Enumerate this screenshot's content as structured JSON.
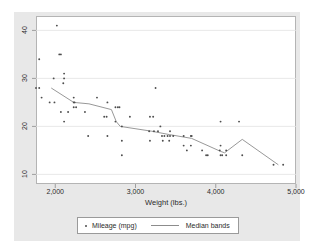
{
  "chart_data": {
    "type": "scatter",
    "title": "",
    "xlabel": "Weight (lbs.)",
    "ylabel": "",
    "xlim": [
      1760,
      5000
    ],
    "ylim": [
      8,
      43
    ],
    "xticks": [
      2000,
      3000,
      4000,
      5000
    ],
    "xtick_labels": [
      "2,000",
      "3,000",
      "4,000",
      "5,000"
    ],
    "yticks": [
      10,
      20,
      30,
      40
    ],
    "ytick_labels": [
      "10",
      "20",
      "30",
      "40"
    ],
    "grid": "horizontal",
    "legend_position": "bottom",
    "legend": [
      {
        "label": "Mileage (mpg)",
        "marker": "dot",
        "color": "#4d4d4d"
      },
      {
        "label": "Median bands",
        "marker": "line",
        "color": "#8c8c8c"
      }
    ],
    "series": [
      {
        "name": "Mileage (mpg)",
        "type": "scatter",
        "color": "#4d4d4d",
        "points": [
          [
            2020,
            41
          ],
          [
            1800,
            34
          ],
          [
            2050,
            35
          ],
          [
            2070,
            35
          ],
          [
            1980,
            30
          ],
          [
            2110,
            31
          ],
          [
            2110,
            30
          ],
          [
            2100,
            29
          ],
          [
            1760,
            28
          ],
          [
            1800,
            28
          ],
          [
            3250,
            28
          ],
          [
            1830,
            26
          ],
          [
            2230,
            26
          ],
          [
            2520,
            26
          ],
          [
            1930,
            25
          ],
          [
            1990,
            25
          ],
          [
            2230,
            25
          ],
          [
            2240,
            25
          ],
          [
            2650,
            25
          ],
          [
            2230,
            24
          ],
          [
            2260,
            24
          ],
          [
            2750,
            24
          ],
          [
            2780,
            24
          ],
          [
            2800,
            24
          ],
          [
            2070,
            23
          ],
          [
            2160,
            23
          ],
          [
            2370,
            23
          ],
          [
            2610,
            22
          ],
          [
            2640,
            22
          ],
          [
            2930,
            22
          ],
          [
            3180,
            22
          ],
          [
            3220,
            22
          ],
          [
            2110,
            21
          ],
          [
            2750,
            21
          ],
          [
            4060,
            21
          ],
          [
            4290,
            21
          ],
          [
            2830,
            20
          ],
          [
            3310,
            20
          ],
          [
            3170,
            19
          ],
          [
            3230,
            19
          ],
          [
            3280,
            19
          ],
          [
            3430,
            19
          ],
          [
            2410,
            18
          ],
          [
            2650,
            18
          ],
          [
            3330,
            18
          ],
          [
            3360,
            18
          ],
          [
            3400,
            18
          ],
          [
            3430,
            18
          ],
          [
            3470,
            18
          ],
          [
            3600,
            18
          ],
          [
            3690,
            18
          ],
          [
            3700,
            18
          ],
          [
            2830,
            17
          ],
          [
            3180,
            17
          ],
          [
            3340,
            17
          ],
          [
            3420,
            17
          ],
          [
            3600,
            16
          ],
          [
            3690,
            16
          ],
          [
            4060,
            16
          ],
          [
            3640,
            15
          ],
          [
            3830,
            15
          ],
          [
            4050,
            15
          ],
          [
            4130,
            15
          ],
          [
            4080,
            14
          ],
          [
            2830,
            14
          ],
          [
            3880,
            14
          ],
          [
            3900,
            14
          ],
          [
            4060,
            14
          ],
          [
            4130,
            14
          ],
          [
            4330,
            14
          ],
          [
            4720,
            12
          ],
          [
            4840,
            12
          ]
        ]
      },
      {
        "name": "Median bands",
        "type": "line",
        "color": "#8c8c8c",
        "points": [
          [
            1950,
            28
          ],
          [
            2230,
            25
          ],
          [
            2420,
            24.7
          ],
          [
            2700,
            23.5
          ],
          [
            2760,
            21
          ],
          [
            2810,
            20
          ],
          [
            3200,
            19
          ],
          [
            3420,
            18.3
          ],
          [
            3700,
            17.5
          ],
          [
            4060,
            14.8
          ],
          [
            4110,
            14.5
          ],
          [
            4330,
            17.3
          ],
          [
            4780,
            12
          ]
        ]
      }
    ]
  }
}
